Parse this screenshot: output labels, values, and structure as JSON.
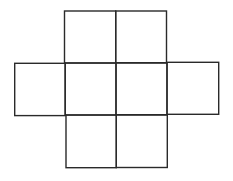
{
  "diagram": {
    "title": "",
    "stroke_color": "#2a2a2a",
    "stroke_width": 1.4,
    "background": "#ffffff",
    "squares": [
      {
        "id": "top-left",
        "x": 64.5,
        "y": 11,
        "w": 51.2,
        "h": 52
      },
      {
        "id": "top-right",
        "x": 115.7,
        "y": 11,
        "w": 50.8,
        "h": 52
      },
      {
        "id": "mid-far-left",
        "x": 14.7,
        "y": 63.3,
        "w": 50.5,
        "h": 52.3
      },
      {
        "id": "mid-left",
        "x": 65.2,
        "y": 63,
        "w": 50.8,
        "h": 52
      },
      {
        "id": "mid-right",
        "x": 116,
        "y": 62.7,
        "w": 51,
        "h": 52
      },
      {
        "id": "mid-far-right",
        "x": 167,
        "y": 62.3,
        "w": 51.7,
        "h": 52
      },
      {
        "id": "bottom-left",
        "x": 66,
        "y": 115,
        "w": 50.3,
        "h": 52.7
      },
      {
        "id": "bottom-right",
        "x": 116.3,
        "y": 115,
        "w": 51,
        "h": 52.5
      }
    ]
  }
}
